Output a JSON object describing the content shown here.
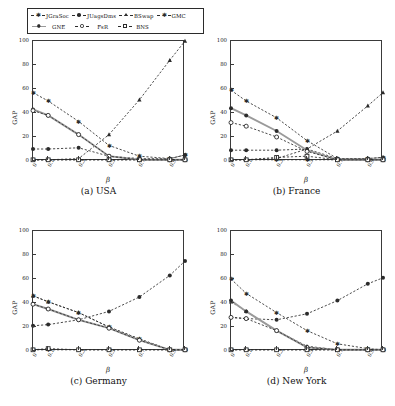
{
  "figure": {
    "axis_y_label": "GAP",
    "axis_x_label": "β",
    "y_ticks": [
      "0",
      "20",
      "40",
      "60",
      "80",
      "100"
    ],
    "x_ticks": [
      "0",
      "0.1",
      "0.3",
      "0.5",
      "0.7",
      "0.9",
      "1"
    ],
    "captions": {
      "a": "(a) USA",
      "b": "(b) France",
      "c": "(c) Germany",
      "d": "(d) New York"
    }
  },
  "legend": {
    "row1": [
      {
        "label": "JGraSoc",
        "marker": "star",
        "line": "dashed"
      },
      {
        "label": "JUagsDms",
        "marker": "dot",
        "line": "dashed"
      },
      {
        "label": "BSwap",
        "marker": "tri",
        "line": "dashed"
      },
      {
        "label": "GMC",
        "marker": "star",
        "line": "dashed"
      }
    ],
    "row2": [
      {
        "label": "GNE",
        "marker": "dot",
        "line": "solid"
      },
      {
        "label": "FsR",
        "marker": "circ",
        "line": "dashed"
      },
      {
        "label": "BNS",
        "marker": "sq",
        "line": "dashed"
      }
    ]
  },
  "colors": {
    "axis": "#3a3a3a",
    "series_dark": "#2b2b2b",
    "series_grey": "#9a9a9a",
    "background": "#ffffff"
  },
  "chart_data": [
    {
      "type": "line",
      "title": "(a) USA",
      "xlabel": "β",
      "ylabel": "GAP",
      "xlim": [
        0,
        1
      ],
      "ylim": [
        0,
        100
      ],
      "grid": false,
      "legend_position": "top-outside",
      "x": [
        0,
        0.1,
        0.3,
        0.5,
        0.7,
        0.9,
        1
      ],
      "series": [
        {
          "name": "JGraSoc",
          "marker": "star",
          "line": "dashed",
          "values": [
            57,
            50,
            33,
            13,
            4,
            2,
            5
          ]
        },
        {
          "name": "JUagsDms",
          "marker": "dot",
          "line": "dashed",
          "values": [
            10,
            10,
            11,
            4,
            2,
            2,
            5
          ]
        },
        {
          "name": "BSwap",
          "marker": "tri",
          "line": "dashed",
          "values": [
            1,
            1,
            2,
            22,
            51,
            84,
            100
          ]
        },
        {
          "name": "GMC",
          "marker": "star",
          "line": "dashed",
          "values": [
            1,
            1,
            1,
            1,
            1,
            1,
            1
          ]
        },
        {
          "name": "GNE",
          "marker": "dot",
          "line": "solid",
          "values": [
            43,
            38,
            22,
            4,
            1,
            1,
            1
          ]
        },
        {
          "name": "FsR",
          "marker": "circ",
          "line": "dashed",
          "values": [
            42,
            38,
            22,
            4,
            1,
            1,
            1
          ]
        },
        {
          "name": "BNS",
          "marker": "sq",
          "line": "dashed",
          "values": [
            1,
            1,
            1,
            1,
            1,
            1,
            1
          ]
        }
      ]
    },
    {
      "type": "line",
      "title": "(b) France",
      "xlabel": "β",
      "ylabel": "GAP",
      "xlim": [
        0,
        1
      ],
      "ylim": [
        0,
        100
      ],
      "grid": false,
      "legend_position": "top-outside",
      "x": [
        0,
        0.1,
        0.3,
        0.5,
        0.7,
        0.9,
        1
      ],
      "series": [
        {
          "name": "JGraSoc",
          "marker": "star",
          "line": "dashed",
          "values": [
            59,
            50,
            36,
            17,
            2,
            2,
            3
          ]
        },
        {
          "name": "JUagsDms",
          "marker": "dot",
          "line": "dashed",
          "values": [
            9,
            9,
            9,
            10,
            2,
            2,
            3
          ]
        },
        {
          "name": "BSwap",
          "marker": "tri",
          "line": "dashed",
          "values": [
            1,
            1,
            2,
            10,
            25,
            46,
            57
          ]
        },
        {
          "name": "GMC",
          "marker": "star",
          "line": "dashed",
          "values": [
            1,
            1,
            1,
            1,
            1,
            1,
            1
          ]
        },
        {
          "name": "GNE",
          "marker": "dot",
          "line": "solid",
          "values": [
            44,
            38,
            25,
            9,
            1,
            1,
            1
          ]
        },
        {
          "name": "FsR",
          "marker": "circ",
          "line": "dashed",
          "values": [
            32,
            29,
            20,
            8,
            1,
            1,
            1
          ]
        },
        {
          "name": "BNS",
          "marker": "sq",
          "line": "dashed",
          "values": [
            1,
            1,
            3,
            4,
            1,
            1,
            1
          ]
        }
      ]
    },
    {
      "type": "line",
      "title": "(c) Germany",
      "xlabel": "β",
      "ylabel": "GAP",
      "xlim": [
        0,
        1
      ],
      "ylim": [
        0,
        100
      ],
      "grid": false,
      "legend_position": "top-outside",
      "x": [
        0,
        0.1,
        0.3,
        0.5,
        0.7,
        0.9,
        1
      ],
      "series": [
        {
          "name": "JGraSoc",
          "marker": "star",
          "line": "dashed",
          "values": [
            46,
            41,
            32,
            20,
            10,
            1,
            1
          ]
        },
        {
          "name": "JUagsDms",
          "marker": "dot",
          "line": "dashed",
          "values": [
            21,
            22,
            26,
            33,
            45,
            63,
            75
          ]
        },
        {
          "name": "BSwap",
          "marker": "tri",
          "line": "dashed",
          "values": [
            46,
            41,
            32,
            20,
            10,
            1,
            1
          ]
        },
        {
          "name": "GMC",
          "marker": "star",
          "line": "dashed",
          "values": [
            1,
            1,
            1,
            1,
            1,
            1,
            1
          ]
        },
        {
          "name": "GNE",
          "marker": "dot",
          "line": "solid",
          "values": [
            39,
            35,
            26,
            19,
            9,
            1,
            1
          ]
        },
        {
          "name": "FsR",
          "marker": "circ",
          "line": "dashed",
          "values": [
            39,
            35,
            26,
            19,
            9,
            1,
            1
          ]
        },
        {
          "name": "BNS",
          "marker": "sq",
          "line": "dashed",
          "values": [
            1,
            2,
            1,
            1,
            1,
            1,
            1
          ]
        }
      ]
    },
    {
      "type": "line",
      "title": "(d) New York",
      "xlabel": "β",
      "ylabel": "GAP",
      "xlim": [
        0,
        1
      ],
      "ylim": [
        0,
        100
      ],
      "grid": false,
      "legend_position": "top-outside",
      "x": [
        0,
        0.1,
        0.3,
        0.5,
        0.7,
        0.9,
        1
      ],
      "series": [
        {
          "name": "JGraSoc",
          "marker": "star",
          "line": "dashed",
          "values": [
            60,
            48,
            32,
            17,
            6,
            2,
            1
          ]
        },
        {
          "name": "JUagsDms",
          "marker": "dot",
          "line": "dashed",
          "values": [
            28,
            27,
            26,
            31,
            42,
            56,
            61
          ]
        },
        {
          "name": "BSwap",
          "marker": "tri",
          "line": "dashed",
          "values": [
            41,
            33,
            17,
            4,
            1,
            1,
            1
          ]
        },
        {
          "name": "GMC",
          "marker": "star",
          "line": "dashed",
          "values": [
            1,
            1,
            1,
            1,
            1,
            1,
            1
          ]
        },
        {
          "name": "GNE",
          "marker": "dot",
          "line": "solid",
          "values": [
            42,
            33,
            17,
            3,
            1,
            1,
            1
          ]
        },
        {
          "name": "FsR",
          "marker": "circ",
          "line": "dashed",
          "values": [
            28,
            27,
            17,
            3,
            1,
            1,
            1
          ]
        },
        {
          "name": "BNS",
          "marker": "sq",
          "line": "dashed",
          "values": [
            1,
            1,
            1,
            1,
            1,
            1,
            1
          ]
        }
      ]
    }
  ]
}
